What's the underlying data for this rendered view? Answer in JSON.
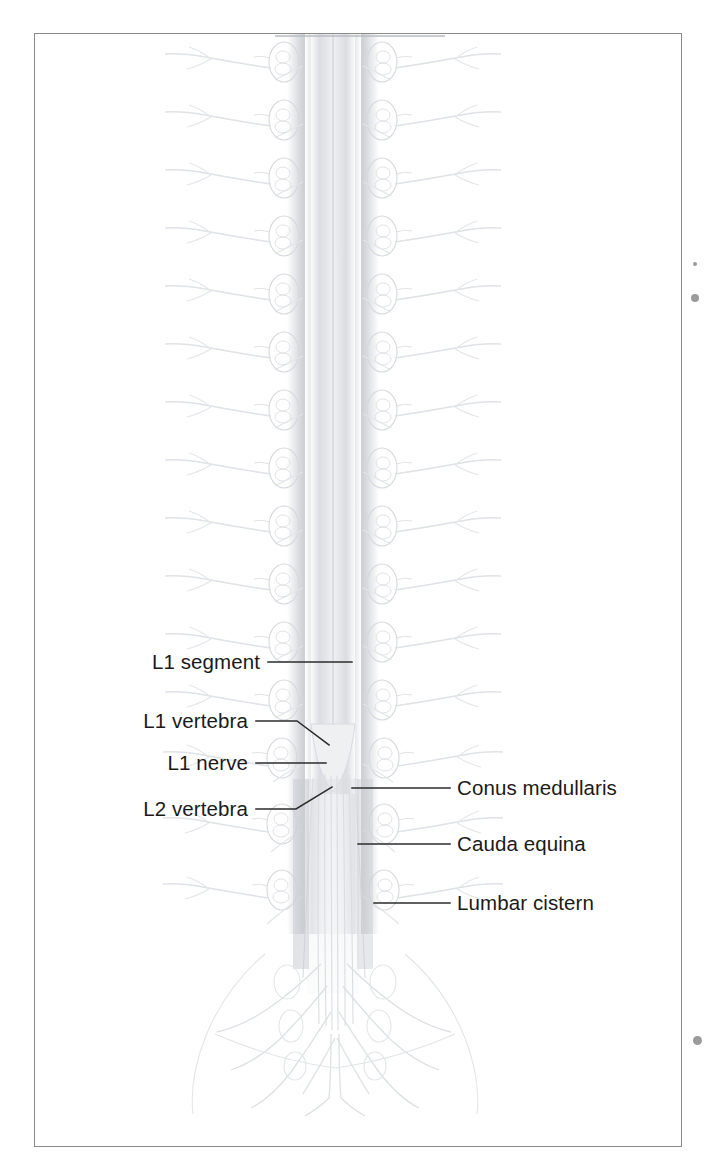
{
  "figure": {
    "name": "spinal-cord-lumbar-region-diagram",
    "frame": {
      "border_color": "#8a8a8a",
      "background_color": "#ffffff"
    },
    "illustration": {
      "style": "faded halftone anatomical line drawing",
      "ink_color": "#d8dade",
      "shadow_color": "#c9ccd1",
      "cord_color": "#e9ebee"
    }
  },
  "callouts": [
    {
      "id": "l1-segment",
      "label": "L1 segment",
      "side": "left",
      "label_right_x": 260,
      "label_baseline_y": 670,
      "leader": {
        "type": "straight",
        "x1": 268,
        "y1": 662,
        "x2": 352,
        "y2": 662
      }
    },
    {
      "id": "l1-vertebra",
      "label": "L1 vertebra",
      "side": "left",
      "label_right_x": 248,
      "label_baseline_y": 729,
      "leader": {
        "type": "elbow",
        "x1": 256,
        "y1": 721,
        "x2": 297,
        "y2": 721,
        "x3": 329,
        "y3": 745
      }
    },
    {
      "id": "l1-nerve",
      "label": "L1 nerve",
      "side": "left",
      "label_right_x": 248,
      "label_baseline_y": 771,
      "leader": {
        "type": "straight",
        "x1": 256,
        "y1": 763,
        "x2": 326,
        "y2": 763
      }
    },
    {
      "id": "l2-vertebra",
      "label": "L2 vertebra",
      "side": "left",
      "label_right_x": 248,
      "label_baseline_y": 817,
      "leader": {
        "type": "elbow",
        "x1": 256,
        "y1": 809,
        "x2": 296,
        "y2": 809,
        "x3": 332,
        "y3": 787
      }
    },
    {
      "id": "conus-medullaris",
      "label": "Conus medullaris",
      "side": "right",
      "label_left_x": 457,
      "label_baseline_y": 796,
      "leader": {
        "type": "straight",
        "x1": 352,
        "y1": 788,
        "x2": 450,
        "y2": 788
      }
    },
    {
      "id": "cauda-equina",
      "label": "Cauda equina",
      "side": "right",
      "label_left_x": 457,
      "label_baseline_y": 852,
      "leader": {
        "type": "straight",
        "x1": 358,
        "y1": 844,
        "x2": 450,
        "y2": 844
      }
    },
    {
      "id": "lumbar-cistern",
      "label": "Lumbar cistern",
      "side": "right",
      "label_left_x": 457,
      "label_baseline_y": 911,
      "leader": {
        "type": "straight",
        "x1": 374,
        "y1": 903,
        "x2": 450,
        "y2": 903
      }
    }
  ],
  "leader_line": {
    "color": "#2b2b2b",
    "width": 1.5
  },
  "edge_specks": [
    {
      "id": "speck-upper-right-small",
      "x": 693,
      "y": 262,
      "size": 4
    },
    {
      "id": "speck-upper-right",
      "x": 691,
      "y": 294,
      "size": 8
    },
    {
      "id": "speck-lower-right",
      "x": 693,
      "y": 1036,
      "size": 9
    }
  ]
}
